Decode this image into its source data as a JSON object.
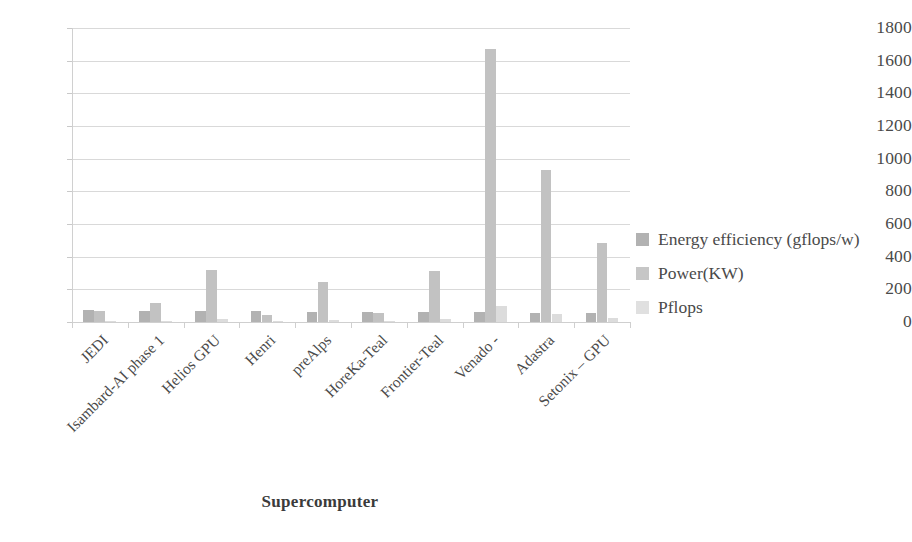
{
  "chart_data": {
    "type": "bar",
    "title": "",
    "xlabel": "Supercomputer",
    "ylabel": "",
    "ylim": [
      0,
      1800
    ],
    "ytick_step": 200,
    "yticks": [
      1800,
      1600,
      1400,
      1200,
      1000,
      800,
      600,
      400,
      200,
      0
    ],
    "grid": true,
    "legend_position": "right",
    "categories": [
      "JEDI",
      "Isambard-AI phase 1",
      "Helios GPU",
      "Henri",
      "preAlps",
      "HoreKa-Teal",
      "Frontier-Teal",
      "Venado -",
      "Adastra",
      "Setonix – GPU"
    ],
    "series": [
      {
        "name": "Energy efficiency (gflops/w)",
        "color": "#b2b2b2",
        "values": [
          72.7,
          68.8,
          66.9,
          65.4,
          63.0,
          62.8,
          62.7,
          61.0,
          58.0,
          56.1
        ]
      },
      {
        "name": "Power(KW)",
        "color": "#c6c6c6",
        "values": [
          67.0,
          117.0,
          317.0,
          44.0,
          245.0,
          57.0,
          315.0,
          1674.0,
          930.0,
          484.0
        ]
      },
      {
        "name": "Pflops",
        "color": "#e0e0e0",
        "values": [
          4.5,
          7.4,
          19.1,
          2.9,
          15.0,
          3.6,
          19.2,
          98.5,
          46.1,
          27.2
        ]
      }
    ]
  },
  "legend": {
    "items": [
      {
        "label": "Energy efficiency (gflops/w)"
      },
      {
        "label": "Power(KW)"
      },
      {
        "label": "Pflops"
      }
    ]
  },
  "axis": {
    "x_title": "Supercomputer"
  }
}
